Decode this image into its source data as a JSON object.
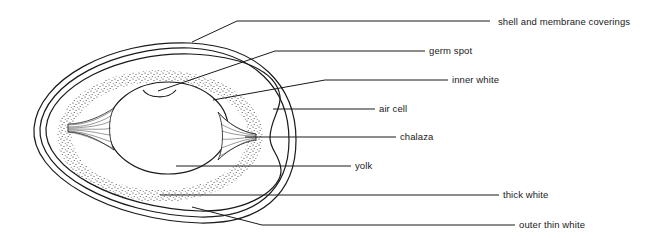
{
  "diagram": {
    "ink_color": "#1a1a1a",
    "background": "#ffffff",
    "labels": [
      {
        "id": "shell",
        "text": "shell and membrane coverings",
        "x": 498,
        "y": 17
      },
      {
        "id": "germ-spot",
        "text": "germ spot",
        "x": 429,
        "y": 47
      },
      {
        "id": "inner-white",
        "text": "inner white",
        "x": 452,
        "y": 76
      },
      {
        "id": "air-cell",
        "text": "air cell",
        "x": 379,
        "y": 105
      },
      {
        "id": "chalaza",
        "text": "chalaza",
        "x": 400,
        "y": 133
      },
      {
        "id": "yolk",
        "text": "yolk",
        "x": 355,
        "y": 161
      },
      {
        "id": "thick-white",
        "text": "thick white",
        "x": 503,
        "y": 190
      },
      {
        "id": "outer-thin-white",
        "text": "outer thin white",
        "x": 519,
        "y": 219
      }
    ]
  }
}
